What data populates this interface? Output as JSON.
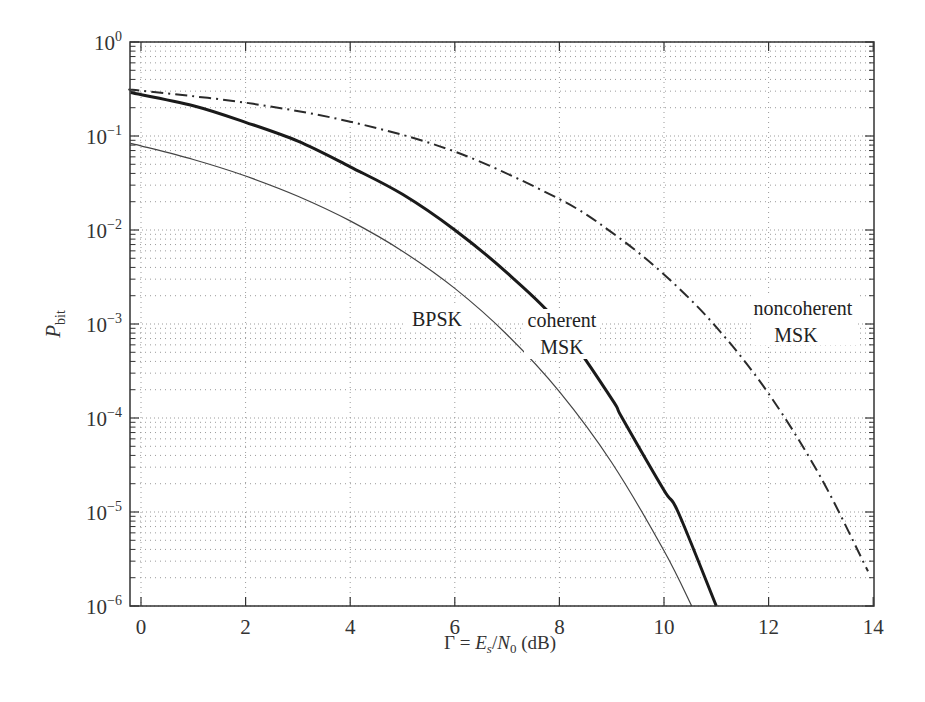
{
  "chart_data": {
    "type": "line",
    "title": "",
    "xlabel": "Γ = E_s/N_0 (dB)",
    "ylabel": "P_bit",
    "xscale": "linear",
    "yscale": "log",
    "xlim": [
      -0.25,
      14
    ],
    "ylim": [
      1e-06,
      1
    ],
    "grid": true,
    "legend": "none (inline curve labels)",
    "x_ticks": [
      0,
      2,
      4,
      6,
      8,
      10,
      12,
      14
    ],
    "y_ticks": [
      {
        "base": "10",
        "exp": "0",
        "value": 1
      },
      {
        "base": "10",
        "exp": "−1",
        "value": 0.1
      },
      {
        "base": "10",
        "exp": "−2",
        "value": 0.01
      },
      {
        "base": "10",
        "exp": "−3",
        "value": 0.001
      },
      {
        "base": "10",
        "exp": "−4",
        "value": 0.0001
      },
      {
        "base": "10",
        "exp": "−5",
        "value": 1e-05
      },
      {
        "base": "10",
        "exp": "−6",
        "value": 1e-06
      }
    ],
    "series": [
      {
        "name": "BPSK",
        "style": "thin-solid",
        "x": [
          -0.2,
          0,
          1,
          2,
          3,
          4,
          5,
          6,
          7,
          8,
          9,
          10,
          10.53
        ],
        "y": [
          0.0835,
          0.0786,
          0.0563,
          0.0375,
          0.0229,
          0.0125,
          0.00595,
          0.00239,
          0.00077,
          0.000191,
          3.36e-05,
          3.87e-06,
          1e-06
        ]
      },
      {
        "name": "coherent MSK",
        "style": "thick-solid",
        "x": [
          -0.2,
          1,
          2,
          3,
          4,
          5,
          6,
          7,
          8,
          9,
          9.2,
          10,
          10.27,
          11.0
        ],
        "y": [
          0.29,
          0.21,
          0.14,
          0.088,
          0.047,
          0.024,
          0.01,
          0.0035,
          0.001,
          0.00016,
          0.0001,
          1.7e-05,
          1e-05,
          1e-06
        ]
      },
      {
        "name": "noncoherent MSK",
        "style": "dash-dot",
        "x": [
          -0.2,
          0,
          2,
          4,
          6,
          8,
          9,
          10,
          11,
          12,
          13,
          13.9
        ],
        "y": [
          0.31,
          0.303,
          0.226,
          0.142,
          0.0683,
          0.0213,
          0.00943,
          0.00337,
          0.000927,
          0.000182,
          2.32e-05,
          2.34e-06
        ]
      }
    ],
    "annotations": [
      {
        "text": [
          "BPSK"
        ],
        "x": 5.6,
        "y": 0.001
      },
      {
        "text": [
          "coherent",
          "MSK"
        ],
        "x": 8.0,
        "y": 0.0008
      },
      {
        "text": [
          "noncoherent",
          "MSK"
        ],
        "x": 12.5,
        "y": 0.0012
      }
    ]
  },
  "labels": {
    "bpsk": "BPSK",
    "coherent_line1": "coherent",
    "coherent_line2": "MSK",
    "noncoherent_line1": "noncoherent",
    "noncoherent_line2": "MSK",
    "y_axis_P": "P",
    "y_axis_sub": "bit",
    "x_axis_gamma": "Γ = ",
    "x_axis_E": "E",
    "x_axis_s": "s",
    "x_axis_slash": "/",
    "x_axis_N": "N",
    "x_axis_0": "0",
    "x_axis_unit": " (dB)"
  },
  "colors": {
    "axis": "#333333",
    "grid": "#9a9a9a",
    "bpsk": "#444444",
    "coherent": "#1a1a1a",
    "noncoherent": "#2a2a2a"
  }
}
